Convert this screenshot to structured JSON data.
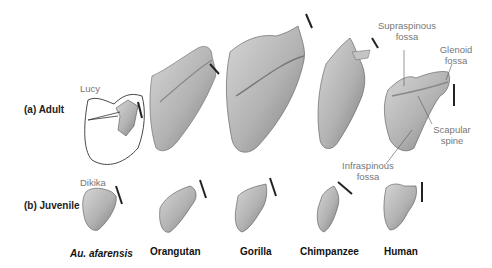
{
  "figure": {
    "rows": [
      {
        "id": "adult",
        "label": "(a) Adult"
      },
      {
        "id": "juvenile",
        "label": "(b) Juvenile"
      }
    ],
    "species": [
      {
        "name": "Au. afarensis",
        "italic": true
      },
      {
        "name": "Orangutan",
        "italic": false
      },
      {
        "name": "Gorilla",
        "italic": false
      },
      {
        "name": "Chimpanzee",
        "italic": false
      },
      {
        "name": "Human",
        "italic": false
      }
    ],
    "specimen_labels": {
      "adult_afarensis": "Lucy",
      "juvenile_afarensis": "Dikika"
    },
    "annotations": {
      "supraspinous": {
        "line1": "Supraspinous",
        "line2": "fossa"
      },
      "glenoid": {
        "line1": "Glenoid",
        "line2": "fossa"
      },
      "scapular_spine": {
        "line1": "Scapular",
        "line2": "spine"
      },
      "infraspinous": {
        "line1": "Infraspinous",
        "line2": "fossa"
      }
    },
    "colors": {
      "bone_fill": "#b8b8b8",
      "bone_shade": "#8a8a8a",
      "outline": "#333333",
      "label_gray": "#777777",
      "text_dark": "#111111"
    }
  }
}
